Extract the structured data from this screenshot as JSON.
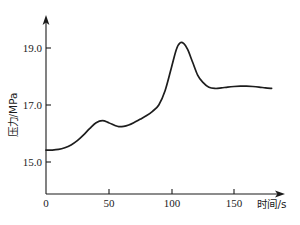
{
  "chart_data": {
    "type": "line",
    "title": "",
    "xlabel": "时间/s",
    "ylabel": "压力/MPa",
    "xlim": [
      0,
      180
    ],
    "ylim": [
      14.0,
      19.8
    ],
    "xticks": [
      0,
      50,
      100,
      150
    ],
    "xtick_labels": [
      "0",
      "50",
      "100",
      "150"
    ],
    "yticks": [
      15.0,
      17.0,
      19.0
    ],
    "ytick_labels": [
      "15.0",
      "17.0",
      "19.0"
    ],
    "grid": false,
    "legend": false,
    "axis_arrows": true,
    "series": [
      {
        "name": "压力",
        "x": [
          0,
          5,
          10,
          15,
          20,
          25,
          30,
          35,
          40,
          45,
          50,
          55,
          58,
          62,
          66,
          70,
          75,
          80,
          85,
          90,
          95,
          100,
          104,
          107,
          110,
          113,
          117,
          121,
          125,
          130,
          135,
          140,
          145,
          150,
          155,
          160,
          165,
          170,
          175,
          180
        ],
        "y": [
          15.42,
          15.42,
          15.44,
          15.5,
          15.6,
          15.75,
          15.95,
          16.18,
          16.38,
          16.45,
          16.38,
          16.28,
          16.24,
          16.25,
          16.3,
          16.38,
          16.5,
          16.62,
          16.78,
          17.0,
          17.5,
          18.3,
          18.95,
          19.18,
          19.15,
          18.95,
          18.5,
          18.05,
          17.8,
          17.62,
          17.58,
          17.6,
          17.63,
          17.65,
          17.66,
          17.66,
          17.65,
          17.63,
          17.6,
          17.58
        ]
      }
    ],
    "annotations": {
      "first_local_peak": {
        "x": 45,
        "y": 16.45
      },
      "local_trough": {
        "x": 58,
        "y": 16.24
      },
      "global_peak": {
        "x": 107,
        "y": 19.18
      },
      "plateau_level": 17.62,
      "initial_level": 15.42
    }
  },
  "colors": {
    "curve": "#1d1d1d",
    "axis": "#1a1a1a",
    "background": "#ffffff"
  }
}
